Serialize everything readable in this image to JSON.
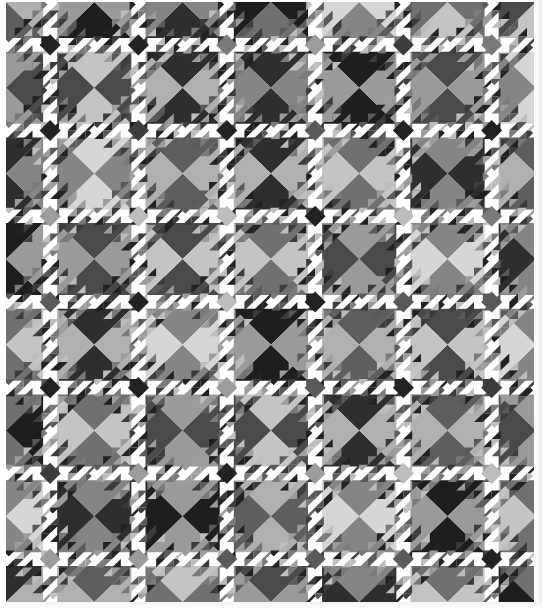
{
  "image": {
    "subject": "Ocean Waves pattern quilt",
    "palette": "grayscale",
    "width": 542,
    "height": 610
  },
  "quilt": {
    "cols": 6,
    "rows": 7,
    "block_w": 88.3,
    "block_h": 85.7,
    "small_tri_per_band": 4,
    "colors": {
      "background": "#f2f2f2",
      "light": "#ffffff",
      "triangle_tones": [
        "#1e1e1e",
        "#2e2e2e",
        "#4a4a4a",
        "#5e5e5e",
        "#707070",
        "#858585",
        "#9a9a9a",
        "#b0b0b0",
        "#c4c4c4",
        "#d6d6d6"
      ],
      "small_tones": [
        "#222222",
        "#3c3c3c",
        "#5a5a5a",
        "#7a7a7a",
        "#9c9c9c",
        "#bdbdbd"
      ]
    },
    "big_triangle_tone_map": [
      [
        3,
        6,
        1,
        0,
        5,
        4,
        8
      ],
      [
        2,
        8,
        7,
        1,
        6,
        2,
        5
      ],
      [
        1,
        5,
        3,
        7,
        4,
        1,
        3
      ],
      [
        6,
        2,
        8,
        4,
        2,
        5,
        1
      ],
      [
        4,
        7,
        5,
        6,
        3,
        8,
        5
      ],
      [
        0,
        4,
        2,
        8,
        7,
        3,
        2
      ],
      [
        5,
        1,
        6,
        3,
        5,
        6,
        4
      ],
      [
        7,
        3,
        4,
        2,
        1,
        4,
        0
      ]
    ]
  }
}
